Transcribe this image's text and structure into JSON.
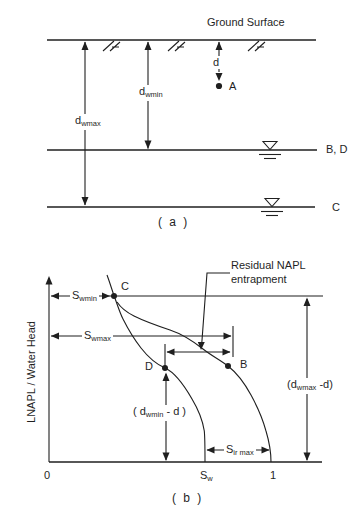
{
  "colors": {
    "ink": "#1f1f1f",
    "background": "#ffffff"
  },
  "panel_a": {
    "caption": "( a )",
    "ground_surface": "Ground Surface",
    "d_label": "d",
    "dwmin": {
      "base": "d",
      "sub": "wmin"
    },
    "dwmax": {
      "base": "d",
      "sub": "wmax"
    },
    "points": {
      "a": "A",
      "bd": "B, D",
      "c": "C"
    }
  },
  "panel_b": {
    "caption": "( b )",
    "y_axis_label": "LNAPL / Water Head",
    "x_ticks": {
      "zero": "0",
      "sw": {
        "base": "S",
        "sub": "w"
      },
      "one": "1"
    },
    "annotation": {
      "line1": "Residual NAPL",
      "line2": "entrapment"
    },
    "swmin": {
      "base": "S",
      "sub": "wmin"
    },
    "swmax": {
      "base": "S",
      "sub": "wmax"
    },
    "sirmax": {
      "base": "S",
      "sub": "ir max"
    },
    "dwmin_minus_d": {
      "pre": "( d",
      "sub": "wmin",
      "post": " - d )"
    },
    "dwmax_minus_d": {
      "pre": "(d",
      "sub": "wmax",
      "post": " -d)"
    },
    "points": {
      "b": "B",
      "c": "C",
      "d": "D"
    }
  }
}
